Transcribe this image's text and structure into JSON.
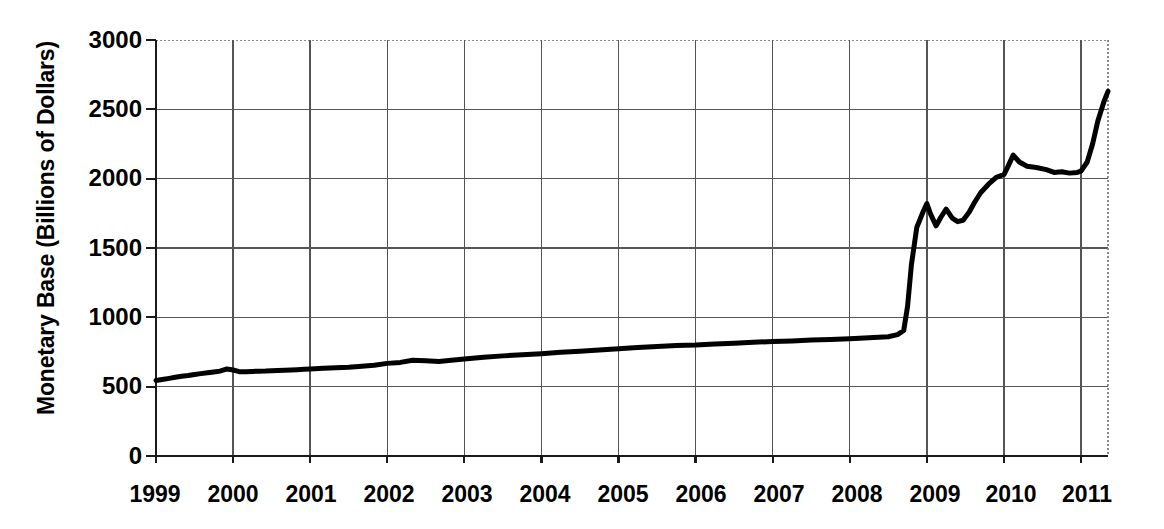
{
  "chart_data": {
    "type": "line",
    "title": "",
    "xlabel": "",
    "ylabel": "Monetary Base (Billions of Dollars)",
    "xlim": [
      1999,
      2011.35
    ],
    "ylim": [
      0,
      3000
    ],
    "ytick_labels": [
      "3000",
      "2500",
      "2000",
      "1500",
      "1000",
      "500",
      "0"
    ],
    "ytick_values": [
      3000,
      2500,
      2000,
      1500,
      1000,
      500,
      0
    ],
    "xtick_labels": [
      "1999",
      "2000",
      "2001",
      "2002",
      "2003",
      "2004",
      "2005",
      "2006",
      "2007",
      "2008",
      "2009",
      "2010",
      "2011"
    ],
    "xtick_values": [
      1999,
      2000,
      2001,
      2002,
      2003,
      2004,
      2005,
      2006,
      2007,
      2008,
      2009,
      2010,
      2011
    ],
    "grid": true,
    "legend": "none",
    "series": [
      {
        "name": "Monetary Base",
        "color": "#000000",
        "line_width": 5,
        "x": [
          1999.0,
          1999.08,
          1999.17,
          1999.25,
          1999.33,
          1999.42,
          1999.5,
          1999.58,
          1999.67,
          1999.75,
          1999.83,
          1999.92,
          2000.0,
          2000.08,
          2000.17,
          2000.25,
          2000.33,
          2000.42,
          2000.5,
          2000.58,
          2000.67,
          2000.75,
          2000.83,
          2000.92,
          2001.0,
          2001.17,
          2001.33,
          2001.5,
          2001.67,
          2001.83,
          2002.0,
          2002.17,
          2002.33,
          2002.5,
          2002.67,
          2002.83,
          2003.0,
          2003.25,
          2003.5,
          2003.75,
          2004.0,
          2004.25,
          2004.5,
          2004.75,
          2005.0,
          2005.25,
          2005.5,
          2005.75,
          2006.0,
          2006.25,
          2006.5,
          2006.75,
          2007.0,
          2007.25,
          2007.5,
          2007.75,
          2008.0,
          2008.25,
          2008.5,
          2008.62,
          2008.7,
          2008.75,
          2008.8,
          2008.87,
          2008.95,
          2009.0,
          2009.05,
          2009.12,
          2009.18,
          2009.25,
          2009.33,
          2009.4,
          2009.47,
          2009.55,
          2009.62,
          2009.7,
          2009.8,
          2009.9,
          2010.0,
          2010.05,
          2010.12,
          2010.2,
          2010.3,
          2010.42,
          2010.55,
          2010.65,
          2010.75,
          2010.85,
          2010.95,
          2011.0,
          2011.08,
          2011.15,
          2011.22,
          2011.3,
          2011.35
        ],
        "y": [
          545,
          552,
          560,
          568,
          575,
          580,
          588,
          594,
          600,
          606,
          612,
          628,
          620,
          608,
          608,
          610,
          612,
          613,
          615,
          616,
          618,
          620,
          622,
          625,
          628,
          632,
          636,
          640,
          648,
          655,
          668,
          675,
          690,
          686,
          682,
          690,
          700,
          712,
          722,
          730,
          738,
          748,
          756,
          764,
          774,
          782,
          790,
          796,
          800,
          808,
          814,
          820,
          826,
          830,
          836,
          840,
          846,
          852,
          860,
          875,
          905,
          1080,
          1380,
          1650,
          1760,
          1820,
          1742,
          1660,
          1720,
          1780,
          1715,
          1690,
          1700,
          1760,
          1830,
          1900,
          1960,
          2010,
          2030,
          2085,
          2170,
          2120,
          2090,
          2080,
          2065,
          2045,
          2050,
          2040,
          2045,
          2055,
          2120,
          2250,
          2420,
          2560,
          2630
        ]
      }
    ]
  }
}
